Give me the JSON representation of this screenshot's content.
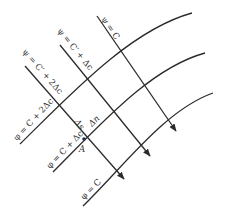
{
  "diagram": {
    "type": "flow-net",
    "streamlines": [
      {
        "label": "ψ = C",
        "x1": 97,
        "y1": 16,
        "x2": 176,
        "y2": 131,
        "lx": 101,
        "ly": 19
      },
      {
        "label": "ψ = C′ + Δc",
        "x1": 60,
        "y1": 45,
        "x2": 150,
        "y2": 156,
        "lx": 57,
        "ly": 31
      },
      {
        "label": "ψ = C′ + 2Δc",
        "x1": 25,
        "y1": 66,
        "x2": 124,
        "y2": 179,
        "lx": 22,
        "ly": 52
      }
    ],
    "equipotentials": [
      {
        "label": "φ = C + 2Δc",
        "path": "M20,144 C70,95 130,30 192,13",
        "lx": 17,
        "ly": 141
      },
      {
        "label": "φ = C + Δc",
        "path": "M53,172 C100,125 150,68 205,53",
        "lx": 50,
        "ly": 169
      },
      {
        "label": "φ = C",
        "path": "M83,206 C125,165 165,110 213,93",
        "lx": 84,
        "ly": 200
      }
    ],
    "point": {
      "label": "A",
      "x": 84,
      "y": 139
    },
    "annotations": {
      "delta_s": "Δs",
      "delta_n": "Δn"
    },
    "colors": {
      "line": "#2b2b2b",
      "text": "#333333",
      "point": "#1f2f5a"
    }
  }
}
